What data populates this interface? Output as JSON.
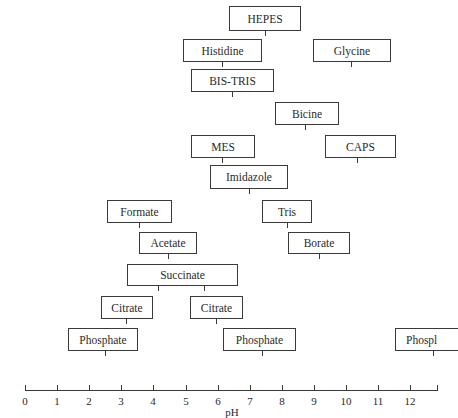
{
  "chart_data": {
    "type": "range-diagram",
    "title": "",
    "xlabel": "pH",
    "ylabel": "",
    "xlim": [
      0,
      12.9
    ],
    "x_ticks": [
      "0",
      "1",
      "2",
      "3",
      "4",
      "5",
      "6",
      "7",
      "8",
      "9",
      "10",
      "11",
      "12"
    ],
    "grid": false,
    "legend": null,
    "buffers": [
      {
        "name": "HEPES",
        "pKa": [
          7.5
        ],
        "range": [
          6.8,
          9.0
        ]
      },
      {
        "name": "Histidine",
        "pKa": [
          6.0
        ],
        "range": [
          5.0,
          7.5
        ]
      },
      {
        "name": "Glycine",
        "pKa": [
          9.8
        ],
        "range": [
          9.0,
          11.4
        ]
      },
      {
        "name": "BIS-TRIS",
        "pKa": [
          6.5
        ],
        "range": [
          5.2,
          7.8
        ]
      },
      {
        "name": "Bicine",
        "pKa": [
          8.3
        ],
        "range": [
          7.8,
          9.8
        ]
      },
      {
        "name": "MES",
        "pKa": [
          6.1
        ],
        "range": [
          5.2,
          7.2
        ]
      },
      {
        "name": "CAPS",
        "pKa": [
          10.4
        ],
        "range": [
          9.3,
          11.6
        ]
      },
      {
        "name": "Imidazole",
        "pKa": [
          7.0
        ],
        "range": [
          5.8,
          8.2
        ]
      },
      {
        "name": "Formate",
        "pKa": [
          3.75
        ],
        "range": [
          2.6,
          4.6
        ]
      },
      {
        "name": "Tris",
        "pKa": [
          8.1
        ],
        "range": [
          7.3,
          8.9
        ]
      },
      {
        "name": "Acetate",
        "pKa": [
          4.76
        ],
        "range": [
          3.6,
          5.4
        ]
      },
      {
        "name": "Borate",
        "pKa": [
          9.2
        ],
        "range": [
          8.2,
          10.2
        ]
      },
      {
        "name": "Succinate",
        "pKa": [
          4.2,
          5.6
        ],
        "range": [
          3.2,
          6.7
        ]
      },
      {
        "name": "Citrate",
        "pKa": [
          3.1
        ],
        "range": [
          2.4,
          4.0
        ]
      },
      {
        "name": "Citrate",
        "pKa": [
          6.0
        ],
        "range": [
          5.2,
          6.8
        ]
      },
      {
        "name": "Phosphate",
        "pKa": [
          2.15
        ],
        "range": [
          1.3,
          3.5
        ]
      },
      {
        "name": "Phosphate",
        "pKa": [
          7.2
        ],
        "range": [
          6.1,
          8.4
        ]
      },
      {
        "name": "Phosphate",
        "pKa": [
          12.7
        ],
        "range": [
          11.6,
          12.9
        ]
      }
    ]
  },
  "labels": {
    "hepes": "HEPES",
    "histidine": "Histidine",
    "glycine": "Glycine",
    "bistris": "BIS-TRIS",
    "bicine": "Bicine",
    "mes": "MES",
    "caps": "CAPS",
    "imidazole": "Imidazole",
    "formate": "Formate",
    "tris": "Tris",
    "acetate": "Acetate",
    "borate": "Borate",
    "succinate": "Succinate",
    "citrate": "Citrate",
    "phosphate": "Phosphate",
    "phosphate_cut": "Phospl",
    "xlabel": "pH",
    "ticks": [
      "0",
      "1",
      "2",
      "3",
      "4",
      "5",
      "6",
      "7",
      "8",
      "9",
      "10",
      "11",
      "12"
    ]
  }
}
